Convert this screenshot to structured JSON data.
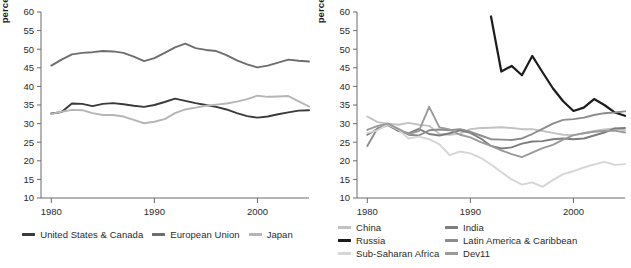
{
  "figure": {
    "panels": [
      "left",
      "right"
    ],
    "axis_color": "#6b6b6b"
  },
  "left_panel": {
    "ylabel": "percent of GDP",
    "legend": [
      {
        "label": "United States & Canada",
        "color": "#3a3a3a",
        "name": "united-states-canada"
      },
      {
        "label": "European Union",
        "color": "#6e6e6e",
        "name": "european-union"
      },
      {
        "label": "Japan",
        "color": "#b5b5b5",
        "name": "japan"
      }
    ]
  },
  "right_panel": {
    "ylabel": "percent of GDP",
    "legend": [
      {
        "label": "China",
        "color": "#c2c2c2",
        "name": "china"
      },
      {
        "label": "India",
        "color": "#7d7d7d",
        "name": "india"
      },
      {
        "label": "Russia",
        "color": "#1c1c1c",
        "name": "russia"
      },
      {
        "label": "Latin America & Caribbean",
        "color": "#8c8c8c",
        "name": "latin-america-caribbean"
      },
      {
        "label": "Sub-Saharan Africa",
        "color": "#d6d6d6",
        "name": "sub-saharan-africa"
      },
      {
        "label": "Dev11",
        "color": "#9a9a9a",
        "name": "dev11"
      }
    ]
  },
  "chart_data": [
    {
      "id": "left",
      "type": "line",
      "title": "",
      "xlabel": "",
      "ylabel": "percent of GDP",
      "xlim": [
        1979,
        2005
      ],
      "ylim": [
        10,
        60
      ],
      "yticks": [
        10,
        15,
        20,
        25,
        30,
        35,
        40,
        45,
        50,
        55,
        60
      ],
      "xticks": [
        1980,
        1990,
        2000
      ],
      "grid": false,
      "legend_position": "below",
      "x": [
        1980,
        1981,
        1982,
        1983,
        1984,
        1985,
        1986,
        1987,
        1988,
        1989,
        1990,
        1991,
        1992,
        1993,
        1994,
        1995,
        1996,
        1997,
        1998,
        1999,
        2000,
        2001,
        2002,
        2003,
        2004,
        2005
      ],
      "series": [
        {
          "name": "United States & Canada",
          "color": "#3a3a3a",
          "values": [
            32.7,
            33.1,
            35.4,
            35.3,
            34.7,
            35.3,
            35.5,
            35.2,
            34.8,
            34.5,
            35.0,
            35.8,
            36.7,
            36.1,
            35.5,
            35.0,
            34.5,
            33.8,
            32.8,
            32.0,
            31.6,
            31.9,
            32.5,
            33.0,
            33.5,
            33.6
          ]
        },
        {
          "name": "European Union",
          "color": "#6e6e6e",
          "values": [
            45.6,
            47.2,
            48.6,
            49.0,
            49.2,
            49.5,
            49.4,
            49.0,
            48.0,
            46.8,
            47.6,
            49.0,
            50.5,
            51.5,
            50.3,
            49.8,
            49.5,
            48.4,
            47.0,
            45.9,
            45.1,
            45.6,
            46.4,
            47.2,
            46.9,
            46.7
          ]
        },
        {
          "name": "Japan",
          "color": "#b5b5b5",
          "values": [
            32.6,
            33.2,
            33.7,
            33.6,
            32.8,
            32.3,
            32.3,
            31.9,
            31.0,
            30.1,
            30.5,
            31.2,
            32.8,
            33.8,
            34.3,
            34.8,
            35.1,
            35.4,
            35.9,
            36.6,
            37.5,
            37.2,
            37.3,
            37.4,
            36.0,
            34.6
          ]
        }
      ]
    },
    {
      "id": "right",
      "type": "line",
      "title": "",
      "xlabel": "",
      "ylabel": "percent of GDP",
      "xlim": [
        1979,
        2005
      ],
      "ylim": [
        10,
        60
      ],
      "yticks": [
        10,
        15,
        20,
        25,
        30,
        35,
        40,
        45,
        50,
        55,
        60
      ],
      "xticks": [
        1980,
        1990,
        2000
      ],
      "grid": false,
      "legend_position": "below",
      "series": [
        {
          "name": "China",
          "color": "#c2c2c2",
          "x": [
            1980,
            1981,
            1982,
            1983,
            1984,
            1985,
            1986,
            1987,
            1988,
            1989,
            1990,
            1991,
            1992,
            1993,
            1994,
            1995,
            1996,
            1997,
            1998,
            1999,
            2000,
            2001,
            2002,
            2003,
            2004,
            2005
          ],
          "values": [
            31.9,
            30.4,
            30.0,
            29.7,
            30.2,
            29.7,
            29.4,
            27.2,
            27.0,
            27.3,
            28.5,
            28.8,
            28.9,
            29.0,
            28.8,
            28.5,
            28.5,
            28.0,
            27.5,
            27.0,
            26.9,
            27.4,
            28.0,
            28.4,
            28.7,
            28.2
          ]
        },
        {
          "name": "India",
          "color": "#7d7d7d",
          "x": [
            1980,
            1981,
            1982,
            1983,
            1984,
            1985,
            1986,
            1987,
            1988,
            1989,
            1990,
            1991,
            1992,
            1993,
            1994,
            1995,
            1996,
            1997,
            1998,
            1999,
            2000,
            2001,
            2002,
            2003,
            2004,
            2005
          ],
          "values": [
            27.0,
            28.6,
            29.6,
            28.0,
            27.4,
            28.6,
            27.2,
            26.8,
            27.4,
            28.2,
            27.5,
            26.0,
            24.0,
            23.3,
            23.6,
            24.6,
            25.2,
            25.3,
            25.8,
            26.0,
            25.8,
            26.0,
            26.8,
            27.6,
            28.7,
            28.8
          ]
        },
        {
          "name": "Russia",
          "color": "#1c1c1c",
          "x": [
            1992,
            1993,
            1994,
            1995,
            1996,
            1997,
            1998,
            1999,
            2000,
            2001,
            2002,
            2003,
            2004,
            2005
          ],
          "values": [
            58.8,
            44.0,
            45.5,
            43.0,
            48.2,
            43.8,
            39.5,
            36.0,
            33.4,
            34.3,
            36.6,
            35.0,
            33.0,
            32.1
          ]
        },
        {
          "name": "Latin America & Caribbean",
          "color": "#8c8c8c",
          "x": [
            1980,
            1981,
            1982,
            1983,
            1984,
            1985,
            1986,
            1987,
            1988,
            1989,
            1990,
            1991,
            1992,
            1993,
            1994,
            1995,
            1996,
            1997,
            1998,
            1999,
            2000,
            2001,
            2002,
            2003,
            2004,
            2005
          ],
          "values": [
            24.0,
            28.8,
            29.8,
            28.5,
            27.0,
            26.8,
            28.2,
            28.4,
            28.2,
            28.5,
            27.8,
            26.8,
            25.8,
            25.7,
            25.6,
            26.0,
            27.2,
            28.6,
            30.0,
            31.0,
            31.2,
            31.6,
            32.3,
            32.8,
            33.0,
            33.3
          ]
        },
        {
          "name": "Sub-Saharan Africa",
          "color": "#d6d6d6",
          "x": [
            1980,
            1981,
            1982,
            1983,
            1984,
            1985,
            1986,
            1987,
            1988,
            1989,
            1990,
            1991,
            1992,
            1993,
            1994,
            1995,
            1996,
            1997,
            1998,
            1999,
            2000,
            2001,
            2002,
            2003,
            2004,
            2005
          ],
          "values": [
            27.5,
            28.2,
            29.8,
            28.4,
            26.0,
            26.5,
            25.8,
            24.4,
            21.5,
            22.5,
            22.0,
            20.8,
            19.0,
            17.0,
            15.0,
            13.6,
            14.2,
            13.0,
            14.8,
            16.4,
            17.2,
            18.2,
            19.0,
            19.7,
            18.9,
            19.1
          ]
        },
        {
          "name": "Dev11",
          "color": "#9a9a9a",
          "x": [
            1980,
            1981,
            1982,
            1983,
            1984,
            1985,
            1986,
            1987,
            1988,
            1989,
            1990,
            1991,
            1992,
            1993,
            1994,
            1995,
            1996,
            1997,
            1998,
            1999,
            2000,
            2001,
            2002,
            2003,
            2004,
            2005
          ],
          "values": [
            28.3,
            29.4,
            30.0,
            28.6,
            27.2,
            28.0,
            34.5,
            29.0,
            28.4,
            27.0,
            26.3,
            25.0,
            24.0,
            22.8,
            21.8,
            21.0,
            22.2,
            23.4,
            24.3,
            25.7,
            26.9,
            27.4,
            27.8,
            28.0,
            28.1,
            27.6
          ]
        }
      ]
    }
  ]
}
